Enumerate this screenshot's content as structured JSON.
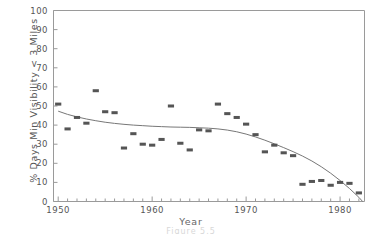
{
  "chart_data": {
    "type": "scatter",
    "title": "",
    "xlabel": "Year",
    "ylabel": "% Days Min Visibility < 3 Miles",
    "xlim": [
      1949.5,
      1982.6
    ],
    "ylim": [
      0,
      100
    ],
    "grid": false,
    "legend": null,
    "x_major_ticks": [
      1950,
      1960,
      1970,
      1980
    ],
    "x_major_tick_labels": [
      "1950",
      "1960",
      "1970",
      "1980"
    ],
    "x_minor_tick_step": 1,
    "y_ticks": [
      0,
      10,
      20,
      30,
      40,
      50,
      60,
      70,
      80,
      90,
      100
    ],
    "y_tick_labels": [
      "0",
      "10",
      "20",
      "30",
      "40",
      "50",
      "60",
      "70",
      "80",
      "90",
      "100"
    ],
    "marker": "filled-rectangle",
    "marker_color": "#555555",
    "line_color": "#777777",
    "x": [
      1950,
      1951,
      1952,
      1953,
      1954,
      1955,
      1956,
      1957,
      1958,
      1959,
      1960,
      1961,
      1962,
      1963,
      1964,
      1965,
      1966,
      1967,
      1968,
      1969,
      1970,
      1971,
      1972,
      1973,
      1974,
      1975,
      1976,
      1977,
      1978,
      1979,
      1980,
      1981,
      1982
    ],
    "values": [
      51,
      38,
      44,
      41,
      58,
      47,
      46.5,
      28,
      35.5,
      30,
      29.5,
      32.5,
      50,
      30.5,
      27,
      37.5,
      37,
      51,
      46,
      44,
      40.5,
      35,
      26,
      29.5,
      25.5,
      24,
      9,
      10.5,
      11,
      8.5,
      10,
      9.5,
      4.5
    ],
    "series": [
      {
        "name": "observations",
        "type": "scatter",
        "values": [
          51,
          38,
          44,
          41,
          58,
          47,
          46.5,
          28,
          35.5,
          30,
          29.5,
          32.5,
          50,
          30.5,
          27,
          37.5,
          37,
          51,
          46,
          44,
          40.5,
          35,
          26,
          29.5,
          25.5,
          24,
          9,
          10.5,
          11,
          8.5,
          10,
          9.5,
          4.5
        ]
      },
      {
        "name": "smoothed-trend",
        "type": "line",
        "x": [
          1950,
          1951,
          1952,
          1953,
          1954,
          1955,
          1956,
          1957,
          1958,
          1959,
          1960,
          1961,
          1962,
          1963,
          1964,
          1965,
          1966,
          1967,
          1968,
          1969,
          1970,
          1971,
          1972,
          1973,
          1974,
          1975,
          1976,
          1977,
          1978,
          1979,
          1980,
          1981,
          1982,
          1982.4
        ],
        "values": [
          47.3,
          45.6,
          44.3,
          43.2,
          42.3,
          41.5,
          40.9,
          40.4,
          40.0,
          39.7,
          39.4,
          39.2,
          39.0,
          38.9,
          38.8,
          38.6,
          38.4,
          38.0,
          37.4,
          36.5,
          35.3,
          33.8,
          32.1,
          30.2,
          28.2,
          26.1,
          23.8,
          21.2,
          18.2,
          14.8,
          11.0,
          6.8,
          2.2,
          0.0
        ]
      }
    ]
  },
  "axis": {
    "y_title": "% Days Min Visibility < 3 Miles",
    "x_title": "Year"
  },
  "caption": {
    "text": "Figure 5.5"
  }
}
